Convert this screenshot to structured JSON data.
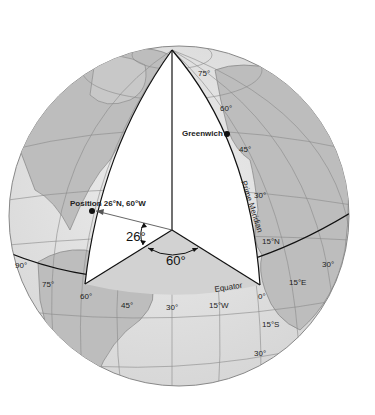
{
  "diagram": {
    "colors": {
      "land": "#bdbdbd",
      "ocean": "#e4e4e4",
      "wedge": "#ffffff",
      "equatorial_plane": "#d0d0d0",
      "lines": "#111111",
      "graticule": "#8a8a8a"
    },
    "points": {
      "greenwich": "Greenwich",
      "position": "Position 26°N, 60°W"
    },
    "angles": {
      "latitude": "26°",
      "longitude": "60°"
    },
    "line_labels": {
      "prime_meridian": "Prime Meridian",
      "equator": "Equator"
    },
    "latitude_labels": [
      "75°",
      "60°",
      "45°",
      "30°",
      "15°N",
      "15°S",
      "30°"
    ],
    "longitude_labels": [
      "90°",
      "75°",
      "60°",
      "45°",
      "30°",
      "15°W",
      "0°",
      "15°E",
      "30°"
    ]
  }
}
